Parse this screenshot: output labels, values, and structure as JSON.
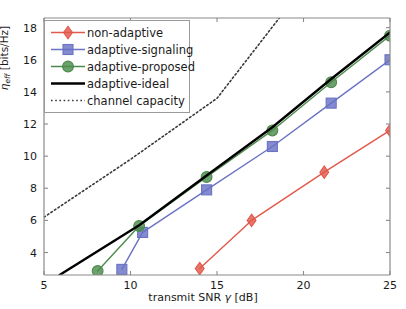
{
  "chart_data": {
    "type": "line",
    "title": "",
    "xlabel": "transmit SNR γ [dB]",
    "ylabel": "η_eff [bits/Hz]",
    "xlim": [
      5,
      25
    ],
    "ylim": [
      2.6,
      18.6
    ],
    "xticks": [
      5,
      10,
      15,
      20,
      25
    ],
    "yticks": [
      4,
      6,
      8,
      10,
      12,
      14,
      16,
      18
    ],
    "grid": false,
    "legend_position": "upper-left",
    "series": [
      {
        "name": "non-adaptive",
        "color": "#e2584a",
        "marker": "diamond",
        "linestyle": "solid",
        "x": [
          14.0,
          17.0,
          21.2,
          25.0
        ],
        "y": [
          3.0,
          6.0,
          9.0,
          11.6
        ]
      },
      {
        "name": "adaptive-signaling",
        "color": "#6a72c4",
        "marker": "square",
        "linestyle": "solid",
        "x": [
          9.5,
          10.7,
          14.4,
          18.2,
          21.6,
          25.0
        ],
        "y": [
          2.95,
          5.25,
          7.9,
          10.6,
          13.3,
          16.0
        ]
      },
      {
        "name": "adaptive-proposed",
        "color": "#4c8b4c",
        "marker": "circle",
        "linestyle": "solid",
        "x": [
          8.1,
          10.5,
          14.4,
          18.2,
          21.6,
          25.0
        ],
        "y": [
          2.85,
          5.65,
          8.7,
          11.6,
          14.6,
          17.5
        ]
      },
      {
        "name": "adaptive-ideal",
        "color": "#000000",
        "marker": "none",
        "linestyle": "solid",
        "x": [
          5.9,
          10.5,
          14.4,
          18.2,
          21.6,
          25.0
        ],
        "y": [
          2.6,
          5.7,
          8.8,
          11.8,
          14.8,
          17.7
        ]
      },
      {
        "name": "channel capacity",
        "color": "#3a3a3a",
        "marker": "none",
        "linestyle": "dotted",
        "x": [
          5.0,
          10.0,
          15.0,
          18.6
        ],
        "y": [
          6.2,
          9.8,
          13.6,
          18.6
        ]
      }
    ]
  },
  "legend": {
    "items": [
      {
        "label": "non-adaptive",
        "marker": "diamond",
        "color": "#e2584a",
        "linestyle": "solid"
      },
      {
        "label": "adaptive-signaling",
        "marker": "square",
        "color": "#6a72c4",
        "linestyle": "solid"
      },
      {
        "label": "adaptive-proposed",
        "marker": "circle",
        "color": "#4c8b4c",
        "linestyle": "solid"
      },
      {
        "label": "adaptive-ideal",
        "marker": "none",
        "color": "#000000",
        "linestyle": "solid"
      },
      {
        "label": "channel capacity",
        "marker": "none",
        "color": "#3a3a3a",
        "linestyle": "dotted"
      }
    ]
  },
  "axes": {
    "x_title_main": "transmit SNR ",
    "x_title_sym": "γ",
    "x_title_unit": " [dB]",
    "y_title_sym": "η",
    "y_title_sub": "eff",
    "y_title_unit": " [bits/Hz]",
    "xtick_labels": [
      "5",
      "10",
      "15",
      "20",
      "25"
    ],
    "ytick_labels": [
      "4",
      "6",
      "8",
      "10",
      "12",
      "14",
      "16",
      "18"
    ]
  }
}
